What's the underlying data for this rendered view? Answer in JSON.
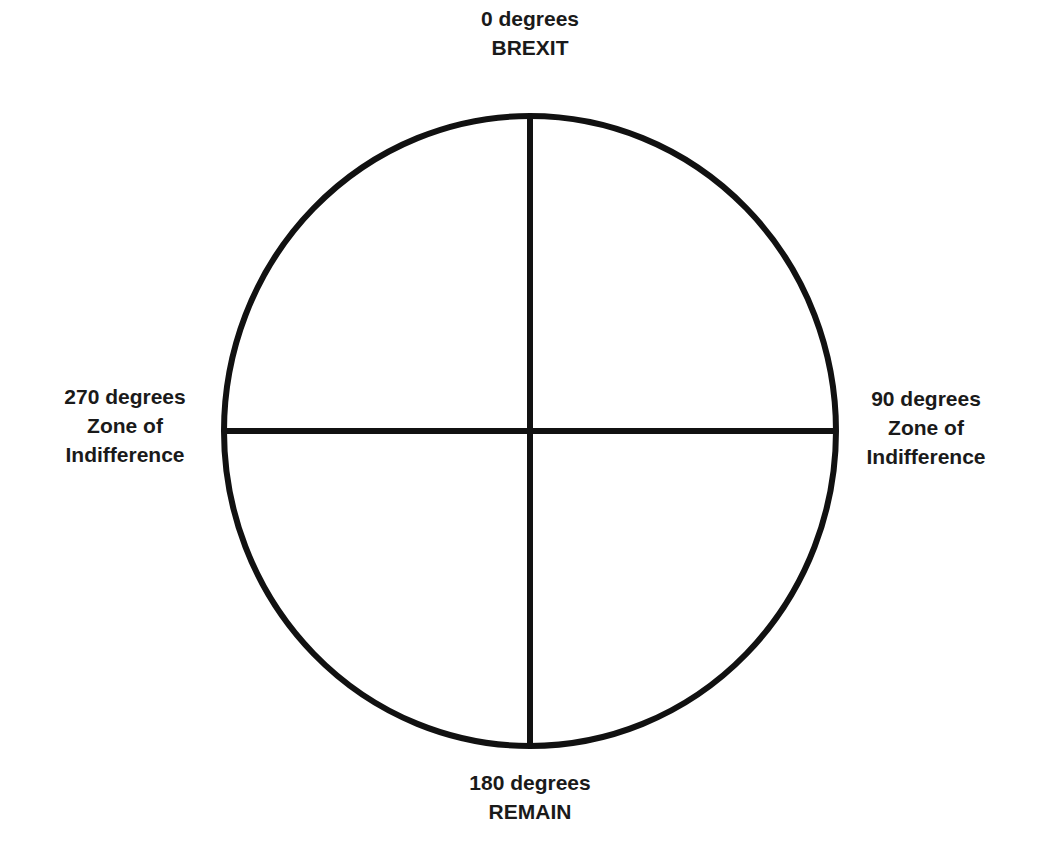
{
  "diagram": {
    "type": "compass-circle",
    "stroke_color": "#111111",
    "background_color": "#ffffff",
    "labels": {
      "top": {
        "angle": "0 degrees",
        "meaning": "BREXIT"
      },
      "right": {
        "angle": "90 degrees",
        "line2": "Zone of",
        "line3": "Indifference"
      },
      "bottom": {
        "angle": "180 degrees",
        "meaning": "REMAIN"
      },
      "left": {
        "angle": "270 degrees",
        "line2": "Zone of",
        "line3": "Indifference"
      }
    }
  }
}
